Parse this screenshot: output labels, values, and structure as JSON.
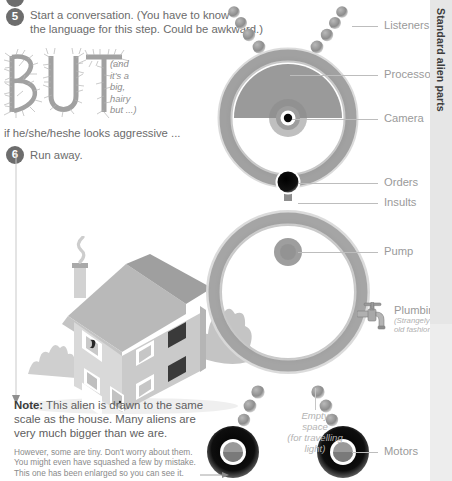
{
  "steps": [
    {
      "number": "5",
      "text_line1": "Start a conversation. (You have to know",
      "text_line2": "the language for this step. Could be awkward.)"
    },
    {
      "number": "6",
      "text_line1": "Run away."
    }
  ],
  "but": {
    "word": "BUT",
    "aside_line1": "(and",
    "aside_line2": "it's a",
    "aside_line3": "big,",
    "aside_line4": "hairy",
    "aside_line5": "but ...)",
    "condition": "if he/she/heshe looks aggressive ..."
  },
  "note": {
    "label": "Note:",
    "main": " This alien is drawn to the same scale as the house. Many aliens are very much bigger than we are.",
    "sub_line1": "However, some are tiny. Don't worry about them.",
    "sub_line2": "You might even have squashed a few by mistake.",
    "sub_line3": "This one has been enlarged so you can see it."
  },
  "sidebar": {
    "title": "Standard alien parts"
  },
  "callouts": [
    {
      "label": "Listeners",
      "sub": ""
    },
    {
      "label": "Processor",
      "sub": ""
    },
    {
      "label": "Camera",
      "sub": ""
    },
    {
      "label": "Orders",
      "sub": ""
    },
    {
      "label": "Insults",
      "sub": ""
    },
    {
      "label": "Pump",
      "sub": ""
    },
    {
      "label": "Plumbing",
      "sub_line1": "(Strangely",
      "sub_line2": "old fashioned)"
    },
    {
      "label": "Motors",
      "sub": ""
    }
  ],
  "interior": {
    "empty_line1": "Empty",
    "empty_line2": "space",
    "empty_line3": "(for travelling",
    "empty_line4": "light)"
  },
  "icons": {
    "faucet": "faucet-icon",
    "arrow": "arrow-down-icon"
  },
  "colors": {
    "body_text": "#6b6b6b",
    "callout_text": "#9a9a9a",
    "bullet_fill": "#6d6d6d",
    "sidebar_bg": "#e6e6e6",
    "alien_ring": "#8e8e8e",
    "alien_face": "#9a9a9a",
    "house_wall": "#d9d9d9",
    "house_roof": "#b9b9b9",
    "tire": "#1a1a1a"
  }
}
